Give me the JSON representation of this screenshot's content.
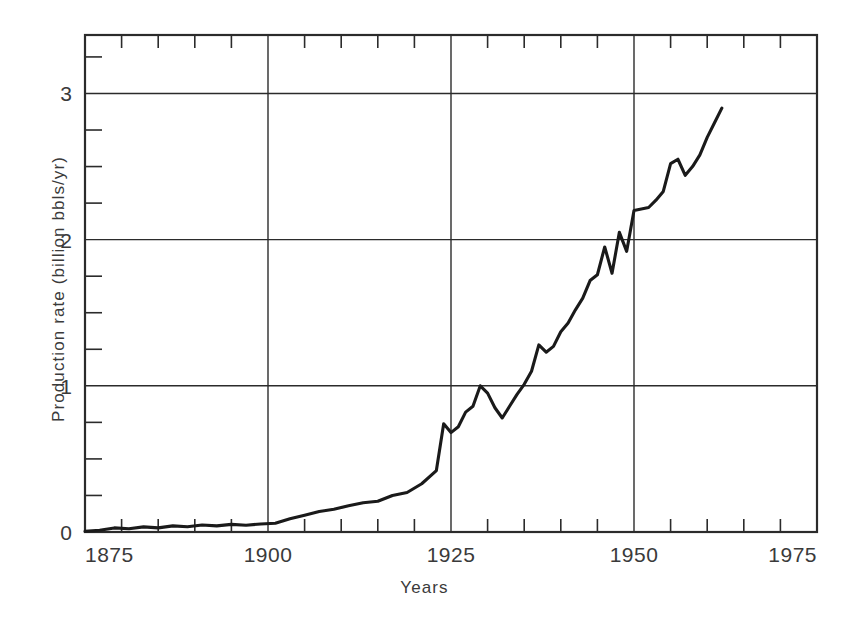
{
  "chart_data": {
    "type": "line",
    "title": "",
    "xlabel": "Years",
    "ylabel": "Production rate (billion bbls/yr)",
    "xlim": [
      1875,
      1975
    ],
    "ylim": [
      0,
      3.4
    ],
    "xticks": [
      1875,
      1900,
      1925,
      1950,
      1975
    ],
    "xtick_labels": [
      "1875",
      "1900",
      "1925",
      "1950",
      "1975"
    ],
    "xminor_step": 5,
    "yticks": [
      0,
      1,
      2,
      3
    ],
    "ytick_labels": [
      "0",
      "1",
      "2",
      "3"
    ],
    "yminor_step": 0.25,
    "grid": "major gridlines on both axes",
    "legend": "none",
    "line_color": "#1a1a1a",
    "series": [
      {
        "name": "World crude oil production rate",
        "x": [
          1875,
          1877,
          1879,
          1881,
          1883,
          1885,
          1887,
          1889,
          1891,
          1893,
          1895,
          1897,
          1899,
          1901,
          1903,
          1905,
          1907,
          1909,
          1911,
          1913,
          1915,
          1917,
          1919,
          1921,
          1923,
          1924,
          1925,
          1926,
          1927,
          1928,
          1929,
          1930,
          1931,
          1932,
          1933,
          1934,
          1935,
          1936,
          1937,
          1938,
          1939,
          1940,
          1941,
          1942,
          1943,
          1944,
          1945,
          1946,
          1947,
          1948,
          1949,
          1950,
          1951,
          1952,
          1953,
          1954,
          1955,
          1956,
          1957,
          1958,
          1959,
          1960,
          1961,
          1962
        ],
        "y": [
          0.005,
          0.012,
          0.028,
          0.022,
          0.035,
          0.028,
          0.042,
          0.036,
          0.048,
          0.042,
          0.052,
          0.046,
          0.055,
          0.06,
          0.09,
          0.115,
          0.14,
          0.155,
          0.18,
          0.2,
          0.21,
          0.25,
          0.27,
          0.33,
          0.42,
          0.74,
          0.68,
          0.72,
          0.82,
          0.86,
          1.0,
          0.95,
          0.85,
          0.78,
          0.86,
          0.94,
          1.01,
          1.1,
          1.28,
          1.23,
          1.27,
          1.37,
          1.43,
          1.52,
          1.6,
          1.72,
          1.76,
          1.95,
          1.77,
          2.05,
          1.92,
          2.2,
          2.21,
          2.22,
          2.27,
          2.33,
          2.52,
          2.55,
          2.44,
          2.5,
          2.58,
          2.7,
          2.8,
          2.9
        ]
      }
    ]
  },
  "axes": {
    "y_title": "Production rate (billion bbls/yr)",
    "x_title": "Years"
  }
}
